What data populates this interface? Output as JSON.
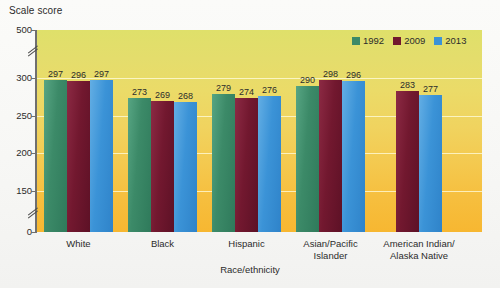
{
  "axis_title": "Scale score",
  "xaxis_title": "Race/ethnicity",
  "legend": {
    "items": [
      {
        "label": "1992",
        "color": "#3c8a68"
      },
      {
        "label": "2009",
        "color": "#72182f"
      },
      {
        "label": "2013",
        "color": "#3b93d7"
      }
    ]
  },
  "yaxis": {
    "ticks": [
      "500",
      "300",
      "250",
      "200",
      "150",
      "0"
    ],
    "break_marks": 2
  },
  "chart_data": {
    "type": "bar",
    "title": "",
    "xlabel": "Race/ethnicity",
    "ylabel": "Scale score",
    "ylim": [
      0,
      500
    ],
    "grid": true,
    "legend_position": "top-right",
    "categories": [
      "White",
      "Black",
      "Hispanic",
      "Asian/Pacific Islander",
      "American Indian/ Alaska Native"
    ],
    "ytick_labels": [
      "0",
      "150",
      "200",
      "250",
      "300",
      "500"
    ],
    "series": [
      {
        "name": "1992",
        "color": "#3c8a68",
        "values": [
          297,
          273,
          279,
          290,
          null
        ]
      },
      {
        "name": "2009",
        "color": "#72182f",
        "values": [
          296,
          269,
          274,
          298,
          283
        ]
      },
      {
        "name": "2013",
        "color": "#3b93d7",
        "values": [
          297,
          268,
          276,
          296,
          277
        ]
      }
    ],
    "data_labels": [
      [
        "297",
        "296",
        "297"
      ],
      [
        "273",
        "269",
        "268"
      ],
      [
        "279",
        "274",
        "276"
      ],
      [
        "290",
        "298",
        "296"
      ],
      [
        "283",
        "277"
      ]
    ]
  },
  "categories_display": [
    {
      "line1": "White",
      "line2": ""
    },
    {
      "line1": "Black",
      "line2": ""
    },
    {
      "line1": "Hispanic",
      "line2": ""
    },
    {
      "line1": "Asian/Pacific",
      "line2": "Islander"
    },
    {
      "line1": "American Indian/",
      "line2": "Alaska Native"
    }
  ]
}
